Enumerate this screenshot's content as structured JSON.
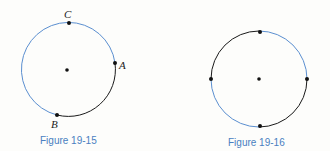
{
  "figures": [
    {
      "caption": "Figure 19-15",
      "center": {
        "x": 67,
        "y": 70
      },
      "radius": 47,
      "points": [
        {
          "label": "C",
          "x": 69,
          "y": 23
        },
        {
          "label": "A",
          "x": 115,
          "y": 63
        },
        {
          "label": "B",
          "x": 57,
          "y": 115
        }
      ],
      "arcs": [
        {
          "from": "A",
          "to": "B",
          "color": "#1a1a1a"
        },
        {
          "from": "B",
          "to": "A",
          "via": "C",
          "color": "#5b8fd0"
        }
      ]
    },
    {
      "caption": "Figure 19-16",
      "center": {
        "x": 259,
        "y": 79
      },
      "radius": 48,
      "points": [
        {
          "label": "",
          "x": 261,
          "y": 32
        },
        {
          "label": "",
          "x": 308,
          "y": 79
        },
        {
          "label": "",
          "x": 261,
          "y": 126
        },
        {
          "label": "",
          "x": 211,
          "y": 79
        }
      ],
      "arcs": [
        {
          "from": "top",
          "to": "right",
          "color": "#5b8fd0"
        },
        {
          "from": "right",
          "to": "bottom",
          "color": "#1a1a1a"
        },
        {
          "from": "bottom",
          "to": "left",
          "color": "#5b8fd0"
        },
        {
          "from": "left",
          "to": "top",
          "color": "#1a1a1a"
        }
      ]
    }
  ],
  "colors": {
    "blue_arc": "#5b8fd0",
    "black_arc": "#1a1a1a",
    "caption": "#4a7fc1"
  }
}
